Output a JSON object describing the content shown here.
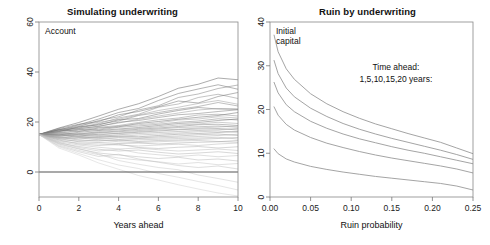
{
  "figure": {
    "width": 490,
    "height": 245,
    "background": "#ffffff",
    "panel_count": 2
  },
  "chart_data": [
    {
      "type": "line",
      "panel": "left",
      "title": "Simulating underwriting",
      "xlabel": "Years ahead",
      "ylabel": "",
      "inside_label": "Account",
      "xlim": [
        0,
        10
      ],
      "ylim": [
        -10,
        60
      ],
      "xticks": [
        0,
        2,
        4,
        6,
        8,
        10
      ],
      "xtick_labels": [
        "0",
        "2",
        "4",
        "6",
        "8",
        "10"
      ],
      "yticks": [
        0,
        20,
        40,
        60
      ],
      "ytick_labels": [
        "0",
        "20",
        "40",
        "60"
      ],
      "grid": false,
      "legend": "none",
      "ytick_label_rotation": -90,
      "reference_line": {
        "y": 0,
        "color": "#555555",
        "style": "solid"
      },
      "start_value": 15,
      "n_paths": 40,
      "x": [
        0,
        1,
        2,
        3,
        4,
        5,
        6,
        7,
        8,
        9,
        10
      ],
      "series": [
        {
          "name": "path-01",
          "values": [
            15,
            17.6,
            19.8,
            22.4,
            25.1,
            27.3,
            30.2,
            33.5,
            35.1,
            37.6,
            36.9
          ],
          "shade": "#5a5a5a"
        },
        {
          "name": "path-02",
          "values": [
            15,
            16.8,
            18.9,
            21.2,
            23.8,
            25.4,
            28.6,
            31.4,
            33.2,
            34.9,
            33.1
          ],
          "shade": "#6a6a6a"
        },
        {
          "name": "path-03",
          "values": [
            15,
            17.1,
            18.2,
            20.6,
            22.1,
            24.8,
            26.5,
            29.8,
            31.2,
            33.4,
            34.8
          ],
          "shade": "#7c7c7c"
        },
        {
          "name": "path-04",
          "values": [
            15,
            16.2,
            17.9,
            19.4,
            21.6,
            23.1,
            25.9,
            27.2,
            29.8,
            31.1,
            29.4
          ],
          "shade": "#8a8a8a"
        },
        {
          "name": "path-05",
          "values": [
            15,
            17.4,
            19.1,
            20.2,
            22.9,
            24.2,
            26.1,
            28.4,
            27.6,
            30.2,
            31.8
          ],
          "shade": "#6e6e6e"
        },
        {
          "name": "path-06",
          "values": [
            15,
            16.4,
            18.6,
            19.9,
            21.1,
            22.8,
            24.6,
            25.9,
            27.4,
            28.6,
            27.1
          ],
          "shade": "#9a9a9a"
        },
        {
          "name": "path-07",
          "values": [
            15,
            17.0,
            17.6,
            19.1,
            20.4,
            22.6,
            23.8,
            25.1,
            26.2,
            27.8,
            26.4
          ],
          "shade": "#828282"
        },
        {
          "name": "path-08",
          "values": [
            15,
            16.1,
            18.1,
            18.8,
            20.9,
            21.4,
            23.2,
            24.6,
            25.8,
            25.2,
            25.1
          ],
          "shade": "#707070"
        },
        {
          "name": "path-09",
          "values": [
            15,
            15.8,
            17.2,
            18.4,
            19.6,
            21.1,
            22.4,
            23.6,
            24.8,
            25.4,
            25.2
          ],
          "shade": "#959595"
        },
        {
          "name": "path-10",
          "values": [
            15,
            16.6,
            17.4,
            18.2,
            19.9,
            20.6,
            21.8,
            22.9,
            23.4,
            24.2,
            24.9
          ],
          "shade": "#787878"
        },
        {
          "name": "path-11",
          "values": [
            15,
            15.4,
            16.8,
            17.9,
            18.6,
            19.8,
            20.9,
            21.6,
            22.8,
            23.1,
            22.4
          ],
          "shade": "#8e8e8e"
        },
        {
          "name": "path-12",
          "values": [
            15,
            16.9,
            16.2,
            17.6,
            18.1,
            19.4,
            20.2,
            21.1,
            21.9,
            22.6,
            23.8
          ],
          "shade": "#6b6b6b"
        },
        {
          "name": "path-13",
          "values": [
            15,
            15.2,
            16.4,
            17.1,
            18.4,
            18.9,
            19.6,
            20.8,
            21.2,
            22.1,
            21.6
          ],
          "shade": "#a0a0a0"
        },
        {
          "name": "path-14",
          "values": [
            15,
            16.3,
            17.0,
            16.8,
            17.9,
            18.4,
            19.1,
            19.9,
            20.4,
            21.3,
            20.8
          ],
          "shade": "#868686"
        },
        {
          "name": "path-15",
          "values": [
            15,
            14.8,
            15.9,
            16.6,
            17.2,
            17.8,
            18.6,
            19.4,
            19.8,
            20.6,
            21.2
          ],
          "shade": "#747474"
        },
        {
          "name": "path-16",
          "values": [
            15,
            15.6,
            15.1,
            16.2,
            16.9,
            17.4,
            18.1,
            18.8,
            19.2,
            19.9,
            19.4
          ],
          "shade": "#9e9e9e"
        },
        {
          "name": "path-17",
          "values": [
            15,
            14.6,
            15.4,
            15.8,
            16.4,
            17.1,
            17.6,
            18.2,
            18.9,
            19.1,
            18.6
          ],
          "shade": "#808080"
        },
        {
          "name": "path-18",
          "values": [
            15,
            15.9,
            14.9,
            15.6,
            16.1,
            16.6,
            17.2,
            17.8,
            18.1,
            18.4,
            17.9
          ],
          "shade": "#909090"
        },
        {
          "name": "path-19",
          "values": [
            15,
            14.2,
            15.2,
            14.8,
            15.6,
            16.2,
            16.8,
            17.1,
            17.6,
            18.0,
            18.4
          ],
          "shade": "#a6a6a6"
        },
        {
          "name": "path-20",
          "values": [
            15,
            15.1,
            14.4,
            15.1,
            15.4,
            15.9,
            16.4,
            16.9,
            17.2,
            17.4,
            16.8
          ],
          "shade": "#888888"
        },
        {
          "name": "path-21",
          "values": [
            15,
            14.4,
            14.8,
            14.2,
            14.9,
            15.4,
            15.8,
            16.2,
            16.6,
            16.9,
            17.4
          ],
          "shade": "#989898"
        },
        {
          "name": "path-22",
          "values": [
            15,
            13.9,
            14.1,
            14.6,
            14.2,
            14.8,
            15.2,
            15.6,
            16.1,
            16.4,
            15.9
          ],
          "shade": "#a8a8a8"
        },
        {
          "name": "path-23",
          "values": [
            15,
            14.9,
            13.8,
            13.9,
            14.4,
            14.1,
            14.6,
            15.1,
            15.4,
            15.8,
            16.2
          ],
          "shade": "#8c8c8c"
        },
        {
          "name": "path-24",
          "values": [
            15,
            13.6,
            14.2,
            13.4,
            13.8,
            13.6,
            14.1,
            14.4,
            14.9,
            15.2,
            14.6
          ],
          "shade": "#9c9c9c"
        },
        {
          "name": "path-25",
          "values": [
            15,
            14.1,
            13.2,
            13.8,
            13.1,
            13.4,
            13.6,
            13.9,
            14.2,
            14.6,
            15.1
          ],
          "shade": "#aaaaaa"
        },
        {
          "name": "path-26",
          "values": [
            15,
            13.2,
            13.6,
            12.9,
            12.6,
            12.9,
            13.1,
            13.4,
            13.6,
            13.9,
            13.2
          ],
          "shade": "#b0b0b0"
        },
        {
          "name": "path-27",
          "values": [
            15,
            13.8,
            12.8,
            12.4,
            12.9,
            12.2,
            12.6,
            12.8,
            13.1,
            13.4,
            13.8
          ],
          "shade": "#a2a2a2"
        },
        {
          "name": "path-28",
          "values": [
            15,
            12.9,
            12.4,
            12.8,
            12.1,
            11.8,
            12.1,
            12.4,
            12.6,
            12.2,
            11.9
          ],
          "shade": "#b4b4b4"
        },
        {
          "name": "path-29",
          "values": [
            15,
            13.4,
            12.1,
            11.8,
            11.4,
            11.6,
            11.2,
            11.6,
            11.9,
            12.1,
            12.6
          ],
          "shade": "#a4a4a4"
        },
        {
          "name": "path-30",
          "values": [
            15,
            12.4,
            11.6,
            11.2,
            10.8,
            10.4,
            10.8,
            11.1,
            10.6,
            11.2,
            11.6
          ],
          "shade": "#b8b8b8"
        },
        {
          "name": "path-31",
          "values": [
            15,
            12.8,
            11.2,
            10.6,
            11.1,
            9.8,
            9.4,
            9.9,
            10.2,
            9.6,
            10.1
          ],
          "shade": "#aeaeae"
        },
        {
          "name": "path-32",
          "values": [
            15,
            12.1,
            10.8,
            9.9,
            9.2,
            9.6,
            8.9,
            8.4,
            8.8,
            9.2,
            8.6
          ],
          "shade": "#bcbcbc"
        },
        {
          "name": "path-33",
          "values": [
            15,
            11.6,
            10.2,
            9.1,
            8.4,
            8.8,
            7.9,
            7.2,
            7.6,
            8.1,
            7.4
          ],
          "shade": "#b2b2b2"
        },
        {
          "name": "path-34",
          "values": [
            15,
            11.9,
            9.8,
            8.4,
            9.1,
            7.6,
            6.9,
            6.2,
            6.8,
            6.1,
            6.6
          ],
          "shade": "#c0c0c0"
        },
        {
          "name": "path-35",
          "values": [
            15,
            11.2,
            9.2,
            7.6,
            6.8,
            6.1,
            5.4,
            5.9,
            4.8,
            5.2,
            4.4
          ],
          "shade": "#b6b6b6"
        },
        {
          "name": "path-36",
          "values": [
            15,
            10.8,
            8.6,
            6.9,
            5.6,
            4.8,
            4.1,
            3.2,
            3.8,
            2.9,
            3.4
          ],
          "shade": "#c4c4c4"
        },
        {
          "name": "path-37",
          "values": [
            15,
            10.4,
            8.1,
            6.2,
            7.1,
            5.2,
            3.9,
            2.6,
            1.8,
            2.4,
            1.2
          ],
          "shade": "#bebebe"
        },
        {
          "name": "path-38",
          "values": [
            15,
            11.4,
            9.4,
            7.2,
            4.6,
            3.1,
            1.8,
            0.9,
            -1.2,
            -2.6,
            -4.1
          ],
          "shade": "#c8c8c8"
        },
        {
          "name": "path-39",
          "values": [
            15,
            10.1,
            7.4,
            4.9,
            2.8,
            1.4,
            -0.6,
            -2.1,
            -3.8,
            -5.4,
            -7.2
          ],
          "shade": "#cccccc"
        },
        {
          "name": "path-40",
          "values": [
            15,
            9.6,
            6.8,
            3.6,
            1.1,
            -1.4,
            -3.2,
            -5.1,
            -6.8,
            -8.4,
            -9.6
          ],
          "shade": "#d0d0d0"
        }
      ]
    },
    {
      "type": "line",
      "panel": "right",
      "title": "Ruin by underwriting",
      "xlabel": "Ruin probability",
      "ylabel": "",
      "inside_label": "Initial\ncapital",
      "annotation_line1": "Time ahead:",
      "annotation_line2": "1,5,10,15,20 years:",
      "xlim": [
        0.0,
        0.25
      ],
      "ylim": [
        0,
        40
      ],
      "xticks": [
        0.0,
        0.05,
        0.1,
        0.15,
        0.2,
        0.25
      ],
      "xtick_labels": [
        "0.00",
        "0.05",
        "0.10",
        "0.15",
        "0.20",
        "0.25"
      ],
      "yticks": [
        0,
        10,
        20,
        30,
        40
      ],
      "ytick_labels": [
        "0",
        "10",
        "20",
        "30",
        "40"
      ],
      "grid": false,
      "legend": "none",
      "ytick_label_rotation": -90,
      "x": [
        0.005,
        0.01,
        0.02,
        0.03,
        0.05,
        0.07,
        0.09,
        0.11,
        0.13,
        0.15,
        0.17,
        0.19,
        0.21,
        0.23,
        0.25
      ],
      "series": [
        {
          "name": "20-years",
          "values": [
            37.0,
            33.2,
            29.3,
            26.9,
            23.6,
            21.3,
            19.5,
            18.0,
            16.7,
            15.6,
            14.5,
            13.5,
            12.5,
            11.2,
            9.9
          ],
          "shade": "#9a9a9a"
        },
        {
          "name": "15-years",
          "values": [
            31.2,
            28.2,
            24.9,
            22.9,
            20.3,
            18.4,
            16.8,
            15.5,
            14.4,
            13.4,
            12.5,
            11.6,
            10.7,
            9.7,
            8.6
          ],
          "shade": "#9a9a9a"
        },
        {
          "name": "10-years",
          "values": [
            26.2,
            23.8,
            21.1,
            19.5,
            17.3,
            15.7,
            14.4,
            13.3,
            12.4,
            11.5,
            10.7,
            10.0,
            9.2,
            8.4,
            7.6
          ],
          "shade": "#9a9a9a"
        },
        {
          "name": "5-years",
          "values": [
            20.6,
            18.7,
            16.6,
            15.3,
            13.6,
            12.3,
            11.3,
            10.4,
            9.6,
            8.9,
            8.3,
            7.7,
            7.1,
            6.4,
            5.5
          ],
          "shade": "#9a9a9a"
        },
        {
          "name": "1-year",
          "values": [
            11.0,
            9.9,
            8.7,
            8.0,
            7.0,
            6.3,
            5.7,
            5.2,
            4.7,
            4.3,
            3.9,
            3.5,
            3.1,
            2.5,
            1.6
          ],
          "shade": "#9a9a9a"
        }
      ]
    }
  ]
}
